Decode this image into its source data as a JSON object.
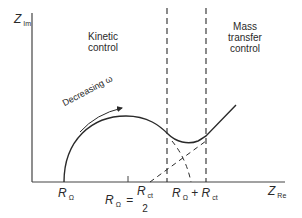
{
  "diagram": {
    "type": "Nyquist plot (impedance)",
    "axes": {
      "y": {
        "symbol": "Z",
        "subscript": "Im"
      },
      "x": {
        "symbol": "Z",
        "subscript": "Re"
      }
    },
    "regions": {
      "kinetic": {
        "line1": "Kinetic",
        "line2": "control"
      },
      "mass_transfer": {
        "line1": "Mass",
        "line2": "transfer",
        "line3": "control"
      }
    },
    "arrow_label": "Decreasing ω",
    "ticks": {
      "r_omega": {
        "symbol": "R",
        "subscript": "Ω"
      },
      "mid": {
        "prefix_symbol": "R",
        "prefix_subscript": "Ω",
        "eq": "=",
        "num_symbol": "R",
        "num_subscript": "ct",
        "den": "2"
      },
      "sum": {
        "a_symbol": "R",
        "a_subscript": "Ω",
        "plus": "+",
        "b_symbol": "R",
        "b_subscript": "ct"
      }
    },
    "colors": {
      "line": "#2a2a2a",
      "background": "#ffffff"
    }
  }
}
